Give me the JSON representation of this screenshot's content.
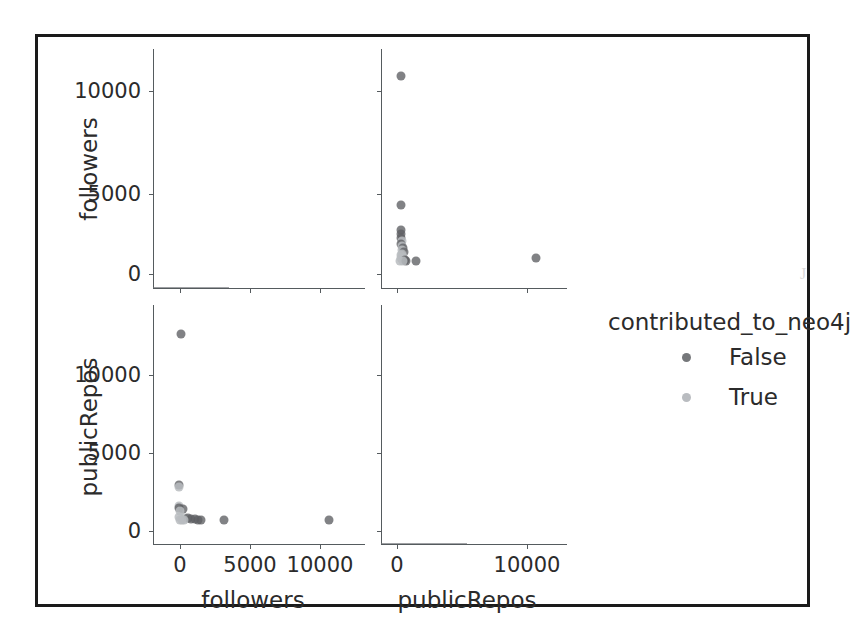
{
  "page": {
    "ghost_text_above_figure": "",
    "background_color": "#ffffff",
    "frame_color": "#1a1a1a"
  },
  "legend": {
    "title": "contributed_to_neo4j",
    "entries": [
      {
        "label": "False",
        "color": "#5d5f63"
      },
      {
        "label": "True",
        "color": "#b9bcc0"
      }
    ]
  },
  "axes": {
    "followers_label": "followers",
    "publicrepos_label": "publicRepos",
    "y_followers_ticks": [
      "0",
      "5000",
      "10000"
    ],
    "y_publicrepos_ticks": [
      "0",
      "5000",
      "10000"
    ],
    "x_followers_ticks": [
      "0",
      "5000",
      "10000"
    ],
    "x_publicrepos_ticks": [
      "0",
      "10000"
    ]
  },
  "chart_data": {
    "type": "scatter",
    "title": "",
    "plot_kind": "pairplot",
    "hue": "contributed_to_neo4j",
    "hue_levels": [
      "False",
      "True"
    ],
    "hue_colors": {
      "False": "#5d5f63",
      "True": "#b9bcc0"
    },
    "variables": [
      "followers",
      "publicRepos"
    ],
    "grid": false,
    "legend_position": "right",
    "panels": [
      {
        "id": "top-left",
        "kind": "kde",
        "xlabel": "followers",
        "ylabel": "followers",
        "xlim": [
          -1500,
          13500
        ],
        "ylim": [
          0,
          1
        ],
        "xticks": [
          0,
          5000,
          10000
        ],
        "yticks": [
          0,
          5000,
          10000
        ],
        "note": "univariate density of followers; sharp spike near 0"
      },
      {
        "id": "top-right",
        "kind": "scatter",
        "xlabel": "publicRepos",
        "ylabel": "followers",
        "xlim": [
          -1200,
          14000
        ],
        "ylim": [
          -1200,
          12800
        ],
        "xticks": [
          0,
          10000
        ],
        "yticks": [
          0,
          5000,
          10000
        ],
        "points": [
          {
            "x": 120,
            "y": 11600,
            "hue": "False"
          },
          {
            "x": 95,
            "y": 3550,
            "hue": "False"
          },
          {
            "x": 130,
            "y": 2000,
            "hue": "False"
          },
          {
            "x": 105,
            "y": 1750,
            "hue": "False"
          },
          {
            "x": 115,
            "y": 1520,
            "hue": "False"
          },
          {
            "x": 210,
            "y": 1320,
            "hue": "True"
          },
          {
            "x": 150,
            "y": 1140,
            "hue": "False"
          },
          {
            "x": 230,
            "y": 980,
            "hue": "True"
          },
          {
            "x": 330,
            "y": 850,
            "hue": "False"
          },
          {
            "x": 190,
            "y": 760,
            "hue": "True"
          },
          {
            "x": 420,
            "y": 640,
            "hue": "False"
          },
          {
            "x": 260,
            "y": 520,
            "hue": "True"
          },
          {
            "x": 170,
            "y": 420,
            "hue": "True"
          },
          {
            "x": 360,
            "y": 330,
            "hue": "True"
          },
          {
            "x": 110,
            "y": 230,
            "hue": "True"
          },
          {
            "x": 280,
            "y": 150,
            "hue": "True"
          },
          {
            "x": 450,
            "y": 120,
            "hue": "False"
          },
          {
            "x": 90,
            "y": 60,
            "hue": "True"
          },
          {
            "x": 600,
            "y": 50,
            "hue": "False"
          },
          {
            "x": 340,
            "y": 30,
            "hue": "True"
          },
          {
            "x": 1500,
            "y": 60,
            "hue": "False"
          },
          {
            "x": 12200,
            "y": 260,
            "hue": "False"
          }
        ]
      },
      {
        "id": "bottom-left",
        "kind": "scatter",
        "xlabel": "followers",
        "ylabel": "publicRepos",
        "xlim": [
          -1500,
          13500
        ],
        "ylim": [
          -1200,
          13800
        ],
        "xticks": [
          0,
          5000,
          10000
        ],
        "yticks": [
          0,
          5000,
          10000
        ],
        "points": [
          {
            "x": 260,
            "y": 12400,
            "hue": "False"
          },
          {
            "x": 130,
            "y": 2400,
            "hue": "False"
          },
          {
            "x": 140,
            "y": 2250,
            "hue": "True"
          },
          {
            "x": 120,
            "y": 1000,
            "hue": "True"
          },
          {
            "x": 135,
            "y": 870,
            "hue": "False"
          },
          {
            "x": 430,
            "y": 800,
            "hue": "False"
          },
          {
            "x": 160,
            "y": 640,
            "hue": "True"
          },
          {
            "x": 120,
            "y": 260,
            "hue": "True"
          },
          {
            "x": 600,
            "y": 230,
            "hue": "True"
          },
          {
            "x": 760,
            "y": 180,
            "hue": "False"
          },
          {
            "x": 1000,
            "y": 160,
            "hue": "False"
          },
          {
            "x": 1320,
            "y": 120,
            "hue": "False"
          },
          {
            "x": 350,
            "y": 90,
            "hue": "True"
          },
          {
            "x": 480,
            "y": 70,
            "hue": "True"
          },
          {
            "x": 210,
            "y": 50,
            "hue": "True"
          },
          {
            "x": 1550,
            "y": 60,
            "hue": "False"
          },
          {
            "x": 1800,
            "y": 40,
            "hue": "False"
          },
          {
            "x": 3550,
            "y": 60,
            "hue": "False"
          },
          {
            "x": 11600,
            "y": 60,
            "hue": "False"
          }
        ]
      },
      {
        "id": "bottom-right",
        "kind": "kde",
        "xlabel": "publicRepos",
        "ylabel": "publicRepos",
        "xlim": [
          -1200,
          14000
        ],
        "ylim": [
          0,
          1
        ],
        "xticks": [
          0,
          10000
        ],
        "yticks": [
          0,
          5000,
          10000
        ],
        "note": "univariate density of publicRepos; sharp spike near 0"
      }
    ]
  }
}
